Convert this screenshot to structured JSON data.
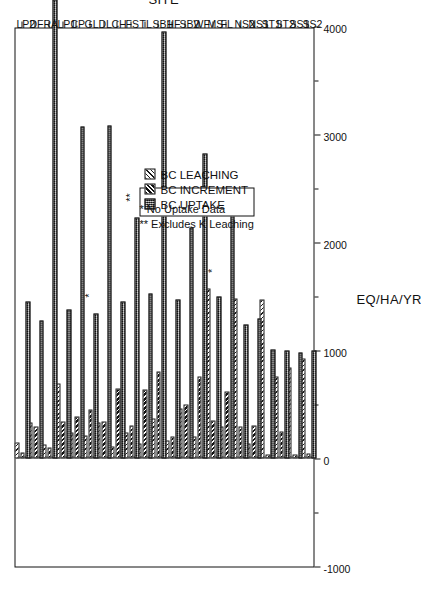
{
  "figure": {
    "y_axis_title": "EQ/HA/YR",
    "x_axis_title": "SITE",
    "orientation": "rotated-90-ccw"
  },
  "legend": {
    "items": [
      {
        "label": "BC LEACHING",
        "swatch": "light-diagonal-hatch"
      },
      {
        "label": "BC INCREMENT",
        "swatch": "dark-diagonal-hatch"
      },
      {
        "label": "BC UPTAKE",
        "swatch": "dark-stipple"
      }
    ],
    "notes": [
      "*  No Uptake Data",
      "** Excludes K Leaching"
    ]
  },
  "chart_data": {
    "type": "bar",
    "title": "",
    "subtitle": "",
    "xlabel": "SITE",
    "ylabel": "EQ/HA/YR",
    "ylim": [
      -1000,
      4000
    ],
    "ytick_labels": [
      "-1000",
      "0",
      "1000",
      "2000",
      "3000",
      "4000"
    ],
    "yticks": [
      -1000,
      0,
      1000,
      2000,
      3000,
      4000
    ],
    "grid": false,
    "legend_position": "inside-lower-left",
    "orientation": "horizontal-bars",
    "categories": [
      "SS2",
      "SS1",
      "ST2",
      "ST1",
      "NS1",
      "NS2",
      "FL",
      "MS",
      "WF",
      "SB2",
      "HF",
      "SB1",
      "TL",
      "FS",
      "CH",
      "DL",
      "GL",
      "CP",
      "LP1",
      "RA",
      "DF",
      "LP2"
    ],
    "series": [
      {
        "name": "BC LEACHING",
        "values": [
          930,
          840,
          760,
          1470,
          140,
          1480,
          300,
          1570,
          200,
          460,
          170,
          370,
          140,
          240,
          110,
          330,
          210,
          240,
          690,
          130,
          330,
          150
        ]
      },
      {
        "name": "BC INCREMENT",
        "values": [
          45,
          40,
          250,
          40,
          310,
          300,
          620,
          350,
          760,
          500,
          200,
          810,
          640,
          310,
          650,
          340,
          450,
          390,
          340,
          100,
          300,
          55
        ]
      },
      {
        "name": "BC UPTAKE",
        "values": [
          1000,
          980,
          1000,
          1010,
          1300,
          1240,
          2350,
          1500,
          2820,
          2140,
          1470,
          3950,
          1530,
          2230,
          1450,
          3080,
          1340,
          3070,
          1380,
          4250,
          1280,
          1450
        ]
      }
    ],
    "annotations": [
      {
        "text": "*",
        "category": "MS",
        "meaning": "No Uptake Data"
      },
      {
        "text": "**",
        "category": "FS",
        "meaning": "Excludes K Leaching"
      },
      {
        "text": "*",
        "category": "GL",
        "meaning": "No Uptake Data"
      }
    ]
  }
}
